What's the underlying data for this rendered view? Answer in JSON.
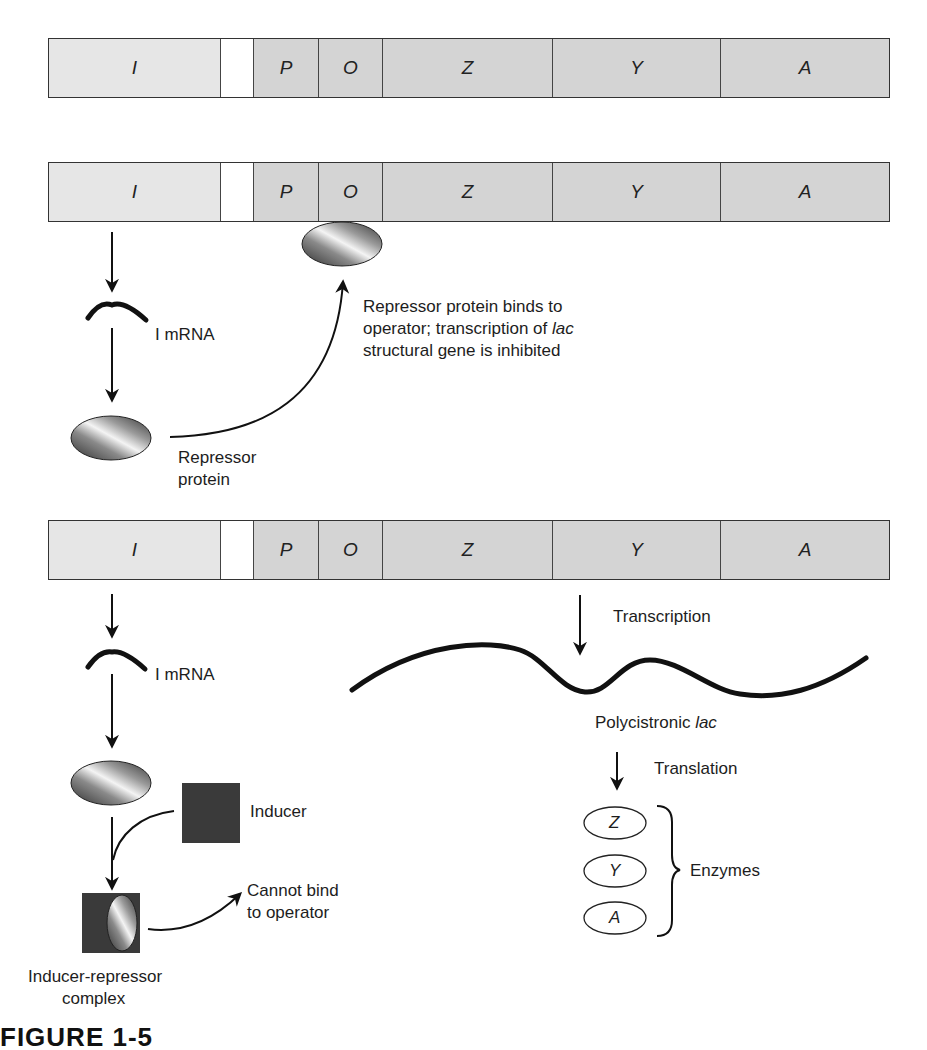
{
  "operon": {
    "segments": [
      {
        "label": "I",
        "width": 172,
        "shade": "light"
      },
      {
        "label": "",
        "width": 33,
        "shade": "blank"
      },
      {
        "label": "P",
        "width": 65,
        "shade": "mid"
      },
      {
        "label": "O",
        "width": 64,
        "shade": "mid"
      },
      {
        "label": "Z",
        "width": 170,
        "shade": "mid"
      },
      {
        "label": "Y",
        "width": 168,
        "shade": "mid"
      },
      {
        "label": "A",
        "width": 170,
        "shade": "mid"
      }
    ],
    "rows_top_y": [
      38,
      162,
      520
    ]
  },
  "panel_repressed": {
    "mrna_label": "I mRNA",
    "repressor_label_line1": "Repressor",
    "repressor_label_line2": "protein",
    "binding_text_line1": "Repressor protein binds to",
    "binding_text_line2_prefix": "operator; transcription of ",
    "binding_text_line2_italic": "lac",
    "binding_text_line3": "structural gene is inhibited"
  },
  "panel_induced": {
    "mrna_label": "I mRNA",
    "inducer_label": "Inducer",
    "cannot_bind_line1": "Cannot bind",
    "cannot_bind_line2": "to operator",
    "complex_label_line1": "Inducer-repressor",
    "complex_label_line2": "complex",
    "transcription_label": "Transcription",
    "polycistronic_prefix": "Polycistronic ",
    "polycistronic_italic": "lac",
    "translation_label": "Translation",
    "enzymes": [
      "Z",
      "Y",
      "A"
    ],
    "enzymes_label": "Enzymes"
  },
  "caption": {
    "partial_text": "FIGURE 1-5"
  },
  "colors": {
    "segment_light": "#e6e6e6",
    "segment_mid": "#d4d4d4",
    "inducer_square": "#3a3a3a",
    "line": "#111111"
  }
}
